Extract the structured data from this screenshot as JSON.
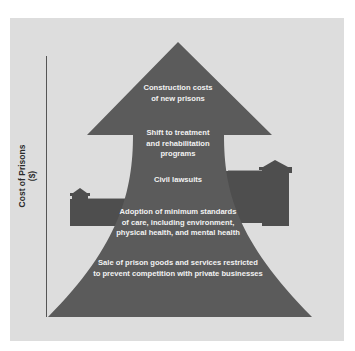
{
  "diagram": {
    "type": "upward-arrow-with-prison-walls",
    "y_axis": {
      "label_line1": "Cost of Prisons",
      "label_line2": "($)"
    },
    "factors": [
      {
        "id": "construction",
        "line1": "Construction costs",
        "line2": "of new prisons"
      },
      {
        "id": "treatment",
        "line1": "Shift to treatment",
        "line2": "and rehabilitation",
        "line3": "programs"
      },
      {
        "id": "lawsuits",
        "line1": "Civil lawsuits"
      },
      {
        "id": "standards",
        "line1": "Adoption of minimum standards",
        "line2": "of care, including environment,",
        "line3": "physical health, and mental health"
      },
      {
        "id": "sales",
        "line1": "Sale of prison goods and services restricted",
        "line2": "to prevent competition with private businesses"
      }
    ],
    "colors": {
      "background": "#ffffff",
      "panel": "#dddddd",
      "arrow": "#5b5b5b",
      "wall": "#4e4e4e",
      "axis": "#444444",
      "arrow_text": "#f2f2f2"
    }
  }
}
